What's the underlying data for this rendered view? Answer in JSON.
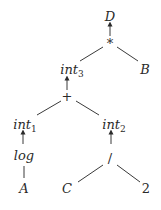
{
  "diagram": {
    "type": "expression-tree",
    "nodes": {
      "D": {
        "label": "D"
      },
      "mul": {
        "label": "*"
      },
      "int3": {
        "label": "int",
        "sub": "3"
      },
      "B": {
        "label": "B"
      },
      "plus": {
        "label": "+"
      },
      "int1": {
        "label": "int",
        "sub": "1"
      },
      "int2": {
        "label": "int",
        "sub": "2"
      },
      "log": {
        "label": "log"
      },
      "A": {
        "label": "A"
      },
      "div": {
        "label": "/"
      },
      "C": {
        "label": "C"
      },
      "two": {
        "label": "2"
      }
    },
    "edges": [
      {
        "from": "mul",
        "to": "D",
        "style": "arrow"
      },
      {
        "from": "mul",
        "to": "int3",
        "style": "line"
      },
      {
        "from": "mul",
        "to": "B",
        "style": "line"
      },
      {
        "from": "plus",
        "to": "int3",
        "style": "arrow"
      },
      {
        "from": "plus",
        "to": "int1",
        "style": "line"
      },
      {
        "from": "plus",
        "to": "int2",
        "style": "line"
      },
      {
        "from": "log",
        "to": "int1",
        "style": "arrow"
      },
      {
        "from": "log",
        "to": "A",
        "style": "line"
      },
      {
        "from": "div",
        "to": "int2",
        "style": "arrow"
      },
      {
        "from": "div",
        "to": "C",
        "style": "line"
      },
      {
        "from": "div",
        "to": "two",
        "style": "line"
      }
    ],
    "colors": {
      "ink": "#2a2a2a",
      "background": "#ffffff"
    }
  }
}
